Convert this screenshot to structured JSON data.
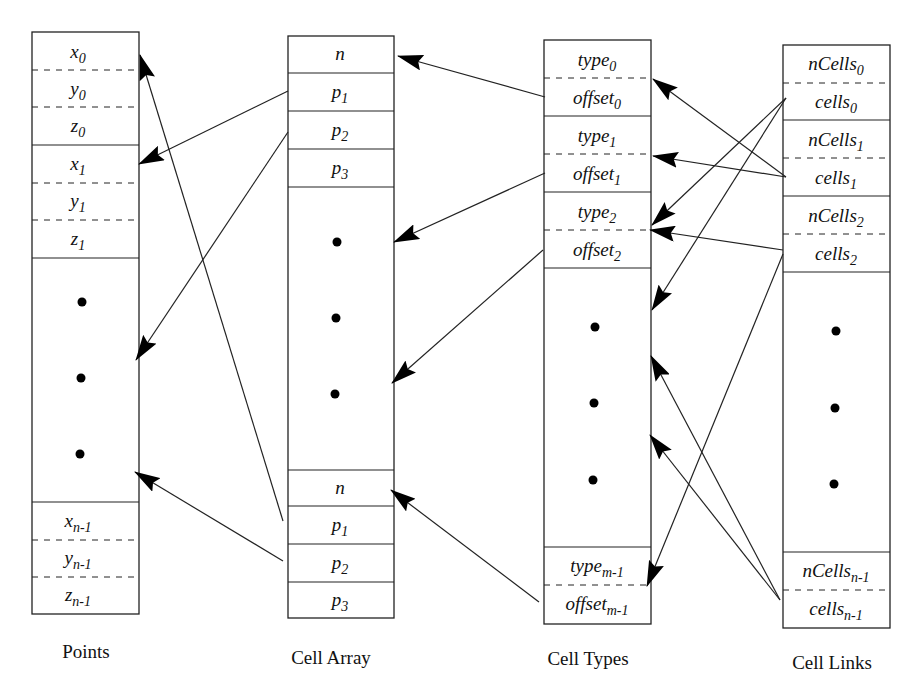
{
  "columns": {
    "points": {
      "label": "Points",
      "top_cells": [
        {
          "base": "x",
          "sub": "0"
        },
        {
          "base": "y",
          "sub": "0"
        },
        {
          "base": "z",
          "sub": "0"
        },
        {
          "base": "x",
          "sub": "1"
        },
        {
          "base": "y",
          "sub": "1"
        },
        {
          "base": "z",
          "sub": "1"
        }
      ],
      "bottom_cells": [
        {
          "base": "x",
          "sub": "n-1"
        },
        {
          "base": "y",
          "sub": "n-1"
        },
        {
          "base": "z",
          "sub": "n-1"
        }
      ]
    },
    "cell_array": {
      "label": "Cell Array",
      "top_cells": [
        {
          "base": "n",
          "sub": ""
        },
        {
          "base": "p",
          "sub": "1"
        },
        {
          "base": "p",
          "sub": "2"
        },
        {
          "base": "p",
          "sub": "3"
        }
      ],
      "bottom_cells": [
        {
          "base": "n",
          "sub": ""
        },
        {
          "base": "p",
          "sub": "1"
        },
        {
          "base": "p",
          "sub": "2"
        },
        {
          "base": "p",
          "sub": "3"
        }
      ]
    },
    "cell_types": {
      "label": "Cell Types",
      "top_cells": [
        {
          "base": "type",
          "sub": "0"
        },
        {
          "base": "offset",
          "sub": "0"
        },
        {
          "base": "type",
          "sub": "1"
        },
        {
          "base": "offset",
          "sub": "1"
        },
        {
          "base": "type",
          "sub": "2"
        },
        {
          "base": "offset",
          "sub": "2"
        }
      ],
      "bottom_cells": [
        {
          "base": "type",
          "sub": "m-1"
        },
        {
          "base": "offset",
          "sub": "m-1"
        }
      ]
    },
    "cell_links": {
      "label": "Cell Links",
      "top_cells": [
        {
          "base": "nCells",
          "sub": "0"
        },
        {
          "base": "cells",
          "sub": "0"
        },
        {
          "base": "nCells",
          "sub": "1"
        },
        {
          "base": "cells",
          "sub": "1"
        },
        {
          "base": "nCells",
          "sub": "2"
        },
        {
          "base": "cells",
          "sub": "2"
        }
      ],
      "bottom_cells": [
        {
          "base": "nCells",
          "sub": "n-1"
        },
        {
          "base": "cells",
          "sub": "n-1"
        }
      ]
    }
  },
  "ellipsis_glyph": "•",
  "arrows": [
    {
      "from": "cell_array.p1 (top)",
      "to": "points.x1"
    },
    {
      "from": "cell_array.p2 (top)",
      "to": "points.ellipsis"
    },
    {
      "from": "cell_array.p1 (bottom)",
      "to": "points.x0"
    },
    {
      "from": "cell_array.p2 (bottom)",
      "to": "points.ellipsis-bottom"
    },
    {
      "from": "cell_types.offset0",
      "to": "cell_array.n (top)"
    },
    {
      "from": "cell_types.offset1",
      "to": "cell_array.ellipsis"
    },
    {
      "from": "cell_types.offset2",
      "to": "cell_array.ellipsis-bottom"
    },
    {
      "from": "cell_types.offset_m-1",
      "to": "cell_array.n (bottom)"
    },
    {
      "from": "cell_links.cells0",
      "to": "cell_types.type2"
    },
    {
      "from": "cell_links.cells0",
      "to": "cell_types.ellipsis"
    },
    {
      "from": "cell_links.cells1",
      "to": "cell_types.type0"
    },
    {
      "from": "cell_links.cells1",
      "to": "cell_types.type1"
    },
    {
      "from": "cell_links.cells2",
      "to": "cell_types.type2"
    },
    {
      "from": "cell_links.cells2",
      "to": "cell_types.type_m-1"
    },
    {
      "from": "cell_links.cells_n-1",
      "to": "cell_types.ellipsis"
    },
    {
      "from": "cell_links.cells_n-1",
      "to": "cell_types.ellipsis-bottom"
    }
  ]
}
